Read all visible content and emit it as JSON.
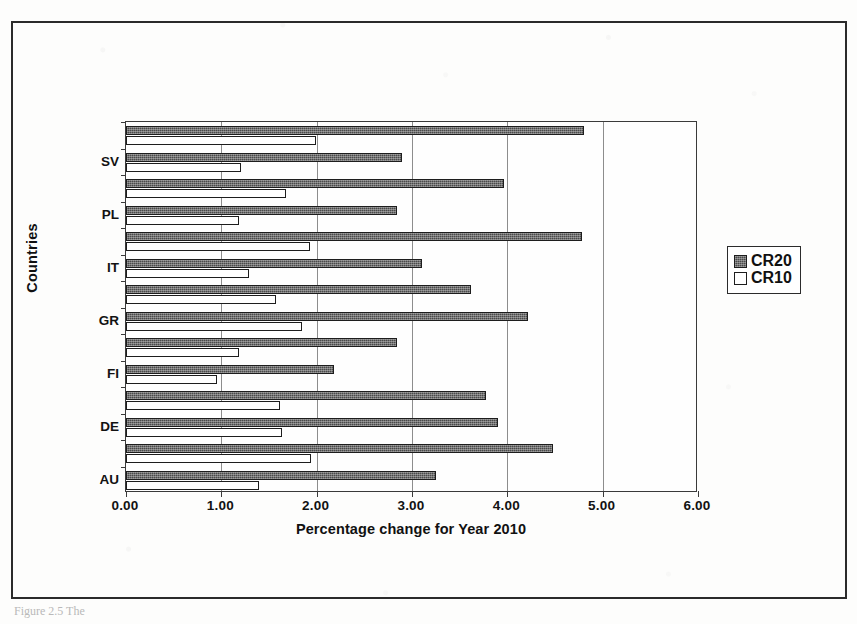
{
  "figure": {
    "caption_ghost": "Figure 2.5  The",
    "x_axis_title": "Percentage change for Year 2010",
    "y_axis_title": "Countries"
  },
  "legend": {
    "position": "right",
    "items": [
      {
        "label": "CR20",
        "swatch": "dark-hatched-swatch",
        "color": "#4a4a4a"
      },
      {
        "label": "CR10",
        "swatch": "white-swatch",
        "color": "#ffffff"
      }
    ]
  },
  "chart_data": {
    "type": "bar",
    "orientation": "horizontal",
    "title": "",
    "xlabel": "Percentage change for Year 2010",
    "ylabel": "Countries",
    "xlim": [
      0,
      6
    ],
    "xticks": [
      0,
      1,
      2,
      3,
      4,
      5,
      6
    ],
    "xticklabels": [
      "0.00",
      "1.00",
      "2.00",
      "3.00",
      "4.00",
      "5.00",
      "6.00"
    ],
    "grid": true,
    "grid_axis": "x",
    "legend_position": "right",
    "visible_category_labels": [
      "SV",
      "PL",
      "IT",
      "GR",
      "FI",
      "DE",
      "AU"
    ],
    "categories": [
      "",
      "SV",
      "",
      "PL",
      "",
      "IT",
      "",
      "GR",
      "",
      "FI",
      "",
      "DE",
      "",
      "AU"
    ],
    "series": [
      {
        "name": "CR20",
        "color": "#4a4a4a",
        "values": [
          4.8,
          2.89,
          3.96,
          2.84,
          4.78,
          3.11,
          3.62,
          4.22,
          2.84,
          2.18,
          3.78,
          3.9,
          4.48,
          3.25
        ]
      },
      {
        "name": "CR10",
        "color": "#ffffff",
        "values": [
          1.99,
          1.21,
          1.68,
          1.19,
          1.93,
          1.29,
          1.57,
          1.85,
          1.19,
          0.95,
          1.62,
          1.64,
          1.94,
          1.4
        ]
      }
    ]
  }
}
